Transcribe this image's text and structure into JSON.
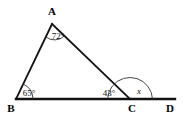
{
  "figure": {
    "background_color": "#ffffff",
    "stroke_color": "#111111",
    "arc_color": "#333333"
  },
  "vertices": [
    {
      "id": "A",
      "label": "A",
      "x": 52,
      "y": 24,
      "label_x": 52,
      "label_y": 15
    },
    {
      "id": "B",
      "label": "B",
      "x": 16,
      "y": 99,
      "label_x": 11,
      "label_y": 111
    },
    {
      "id": "C",
      "label": "C",
      "x": 130,
      "y": 99,
      "label_x": 131,
      "label_y": 111
    },
    {
      "id": "D",
      "label": "D",
      "x": 175,
      "y": 99,
      "label_x": 170,
      "label_y": 111
    }
  ],
  "segments": [
    {
      "id": "AB",
      "from": "A",
      "to": "B",
      "width": 1.8
    },
    {
      "id": "AC",
      "from": "A",
      "to": "C",
      "width": 1.8
    },
    {
      "id": "BD",
      "from": "B",
      "to": "D",
      "width": 2.4
    }
  ],
  "angles": [
    {
      "id": "angle-A",
      "vertex": "A",
      "label": "72°",
      "value": 72,
      "unit": "degrees",
      "label_x": 58,
      "label_y": 39,
      "italic": false
    },
    {
      "id": "angle-B",
      "vertex": "B",
      "label": "65°",
      "value": 65,
      "unit": "degrees",
      "label_x": 29,
      "label_y": 95,
      "italic": false
    },
    {
      "id": "angle-C-interior",
      "vertex": "C",
      "label": "43°",
      "value": 43,
      "unit": "degrees",
      "label_x": 109,
      "label_y": 95,
      "italic": false
    },
    {
      "id": "angle-C-exterior",
      "vertex": "C",
      "label": "x",
      "value": null,
      "unit": "degrees",
      "label_x": 139,
      "label_y": 93,
      "italic": true
    }
  ]
}
